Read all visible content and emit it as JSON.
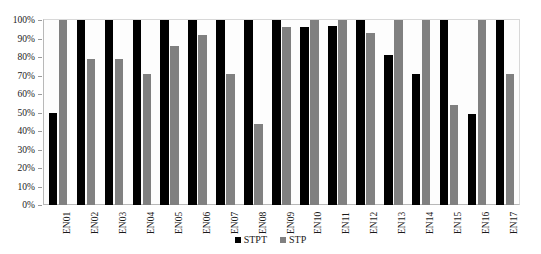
{
  "chart_data": {
    "type": "bar",
    "title": "",
    "xlabel": "",
    "ylabel": "",
    "ylim": [
      0,
      100
    ],
    "y_unit": "%",
    "grid": false,
    "legend_position": "bottom",
    "categories": [
      "EN01",
      "EN02",
      "EN03",
      "EN04",
      "EN05",
      "EN06",
      "EN07",
      "EN08",
      "EN09",
      "EN10",
      "EN11",
      "EN12",
      "EN13",
      "EN14",
      "EN15",
      "EN16",
      "EN17"
    ],
    "y_ticks": [
      "0%",
      "10%",
      "20%",
      "30%",
      "40%",
      "50%",
      "60%",
      "70%",
      "80%",
      "90%",
      "100%"
    ],
    "y_tick_values": [
      0,
      10,
      20,
      30,
      40,
      50,
      60,
      70,
      80,
      90,
      100
    ],
    "series": [
      {
        "name": "STPT",
        "color": "#000000",
        "values": [
          50,
          100,
          100,
          100,
          100,
          100,
          100,
          100,
          100,
          96,
          97,
          100,
          81,
          71,
          100,
          49,
          100
        ]
      },
      {
        "name": "STP",
        "color": "#808080",
        "values": [
          100,
          79,
          79,
          71,
          86,
          92,
          71,
          44,
          96,
          100,
          100,
          93,
          100,
          100,
          54,
          100,
          71
        ]
      }
    ]
  },
  "legend": {
    "items": [
      {
        "label": "STPT",
        "color": "#000000"
      },
      {
        "label": "STP",
        "color": "#808080"
      }
    ]
  }
}
